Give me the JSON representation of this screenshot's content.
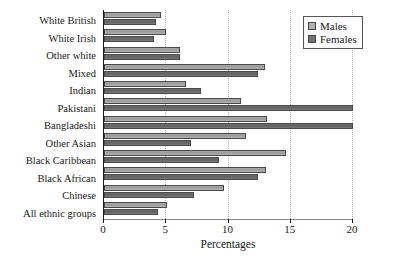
{
  "chart_data": {
    "type": "bar",
    "orientation": "horizontal",
    "title": "",
    "xlabel": "Percentages",
    "ylabel": "",
    "xlim": [
      0,
      20
    ],
    "xticks": [
      0,
      5,
      10,
      15,
      20
    ],
    "grid": "vertical-dotted",
    "legend_position": "top-right",
    "categories": [
      "White British",
      "White Irish",
      "Other white",
      "Mixed",
      "Indian",
      "Pakistani",
      "Bangladeshi",
      "Other Asian",
      "Black Caribbean",
      "Black African",
      "Chinese",
      "All ethnic groups"
    ],
    "series": [
      {
        "name": "Males",
        "color": "#b0b0b0",
        "values": [
          4.6,
          5.0,
          6.1,
          12.9,
          6.6,
          11.0,
          13.1,
          11.4,
          14.6,
          13.0,
          9.6,
          5.1
        ]
      },
      {
        "name": "Females",
        "color": "#707070",
        "values": [
          4.2,
          4.0,
          6.1,
          12.4,
          7.8,
          20.0,
          20.0,
          7.0,
          9.2,
          12.4,
          7.2,
          4.3
        ]
      }
    ]
  },
  "legend": {
    "items": [
      {
        "label": "Males",
        "swatch": "males-swatch"
      },
      {
        "label": "Females",
        "swatch": "females-swatch"
      }
    ]
  }
}
